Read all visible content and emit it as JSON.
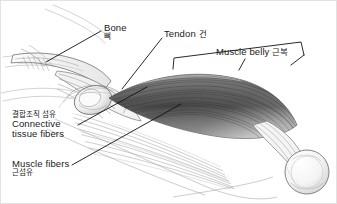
{
  "figure": {
    "background_color": "#ffffff",
    "border_color": "#e2e2e2",
    "ink_color": "#1a1a1a",
    "width": 337,
    "height": 204
  },
  "labels": {
    "bone": {
      "en": "Bone",
      "ko": "뼈"
    },
    "tendon": {
      "en": "Tendon",
      "ko": "건"
    },
    "muscle_belly": {
      "en": "Muscle belly",
      "ko": "근복"
    },
    "connective": {
      "en_line1": "Connective",
      "en_line2": "tissue fibers",
      "ko": "결합조직 섬유"
    },
    "muscle_fibers": {
      "en": "Muscle fibers",
      "ko": "근섬유"
    }
  },
  "artwork": {
    "subject": "skeletal-muscle-with-tendon-and-bone",
    "parts": [
      "proximal-bone-shaft",
      "bone-head-epiphysis-left",
      "tendon-sheath",
      "muscle-belly-striated",
      "connective-tissue-fibers",
      "distal-bone-condyle-right"
    ],
    "muscle_shade_dark": "#4a4a4a",
    "muscle_shade_mid": "#8a8a8a",
    "muscle_shade_light": "#c9c9c9",
    "outline_color": "#5a5a5a"
  },
  "leaders": {
    "bone_pointer": "line from Bone label down-left to bone shaft",
    "tendon_pointer": "line from Tendon label down-left to tendon region",
    "belly_bracket": "bracket spanning the muscle belly",
    "connective_pointer": "long line from Connective label up-right to muscle",
    "muscle_fibers_pointer": "long line from Muscle fibers label up-right to muscle"
  }
}
